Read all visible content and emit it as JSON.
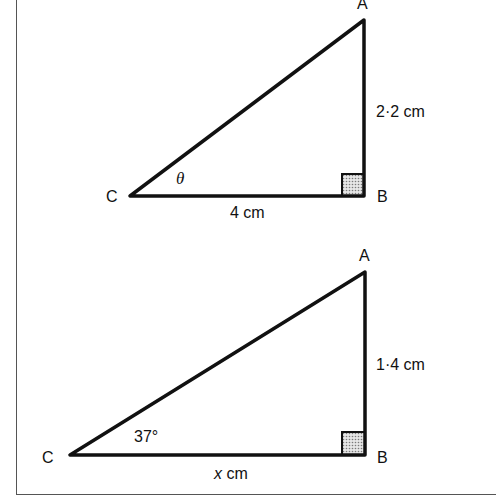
{
  "diagram": {
    "triangle1": {
      "vertices": {
        "A": "A",
        "B": "B",
        "C": "C"
      },
      "side_AB": "2·2 cm",
      "side_CB": "4 cm",
      "angle_C": "θ",
      "right_angle_at": "B"
    },
    "triangle2": {
      "vertices": {
        "A": "A",
        "B": "B",
        "C": "C"
      },
      "side_AB": "1·4 cm",
      "side_CB_var": "x",
      "side_CB_unit": " cm",
      "angle_C": "37°",
      "right_angle_at": "B"
    },
    "colors": {
      "line": "#111111",
      "right_angle_fill": "#bdbdbd",
      "border": "#555555"
    }
  }
}
